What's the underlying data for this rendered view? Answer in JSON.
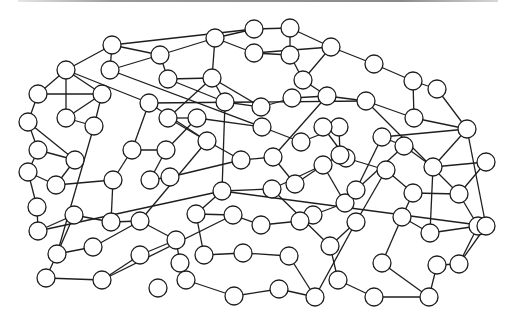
{
  "canvas": {
    "width": 512,
    "height": 322,
    "node_radius": 9,
    "node_fill": "#ffffff",
    "stroke_color": "#1e1e1e",
    "top_bar_color": "#8a8a8a"
  },
  "graph": {
    "nodes": [
      {
        "id": 0,
        "x": 112,
        "y": 45
      },
      {
        "id": 1,
        "x": 110,
        "y": 70
      },
      {
        "id": 2,
        "x": 66,
        "y": 70
      },
      {
        "id": 3,
        "x": 38,
        "y": 94
      },
      {
        "id": 4,
        "x": 102,
        "y": 94
      },
      {
        "id": 5,
        "x": 28,
        "y": 122
      },
      {
        "id": 6,
        "x": 66,
        "y": 118
      },
      {
        "id": 7,
        "x": 94,
        "y": 126
      },
      {
        "id": 8,
        "x": 149,
        "y": 103
      },
      {
        "id": 9,
        "x": 160,
        "y": 55
      },
      {
        "id": 10,
        "x": 168,
        "y": 79
      },
      {
        "id": 11,
        "x": 215,
        "y": 38
      },
      {
        "id": 12,
        "x": 254,
        "y": 29
      },
      {
        "id": 13,
        "x": 254,
        "y": 53
      },
      {
        "id": 14,
        "x": 212,
        "y": 78
      },
      {
        "id": 15,
        "x": 290,
        "y": 28
      },
      {
        "id": 16,
        "x": 290,
        "y": 55
      },
      {
        "id": 17,
        "x": 331,
        "y": 47
      },
      {
        "id": 18,
        "x": 303,
        "y": 80
      },
      {
        "id": 19,
        "x": 225,
        "y": 102
      },
      {
        "id": 20,
        "x": 261,
        "y": 107
      },
      {
        "id": 21,
        "x": 168,
        "y": 118
      },
      {
        "id": 22,
        "x": 197,
        "y": 118
      },
      {
        "id": 23,
        "x": 292,
        "y": 98
      },
      {
        "id": 24,
        "x": 327,
        "y": 96
      },
      {
        "id": 25,
        "x": 374,
        "y": 64
      },
      {
        "id": 26,
        "x": 413,
        "y": 81
      },
      {
        "id": 27,
        "x": 437,
        "y": 89
      },
      {
        "id": 28,
        "x": 366,
        "y": 101
      },
      {
        "id": 29,
        "x": 414,
        "y": 118
      },
      {
        "id": 30,
        "x": 467,
        "y": 129
      },
      {
        "id": 31,
        "x": 382,
        "y": 137
      },
      {
        "id": 32,
        "x": 339,
        "y": 127
      },
      {
        "id": 33,
        "x": 262,
        "y": 127
      },
      {
        "id": 34,
        "x": 301,
        "y": 142
      },
      {
        "id": 35,
        "x": 323,
        "y": 127
      },
      {
        "id": 36,
        "x": 207,
        "y": 141
      },
      {
        "id": 37,
        "x": 241,
        "y": 160
      },
      {
        "id": 38,
        "x": 273,
        "y": 157
      },
      {
        "id": 39,
        "x": 346,
        "y": 158
      },
      {
        "id": 40,
        "x": 404,
        "y": 146
      },
      {
        "id": 41,
        "x": 433,
        "y": 167
      },
      {
        "id": 42,
        "x": 486,
        "y": 162
      },
      {
        "id": 43,
        "x": 386,
        "y": 170
      },
      {
        "id": 44,
        "x": 38,
        "y": 150
      },
      {
        "id": 45,
        "x": 28,
        "y": 172
      },
      {
        "id": 46,
        "x": 75,
        "y": 160
      },
      {
        "id": 47,
        "x": 56,
        "y": 185
      },
      {
        "id": 48,
        "x": 132,
        "y": 150
      },
      {
        "id": 49,
        "x": 113,
        "y": 180
      },
      {
        "id": 50,
        "x": 166,
        "y": 150
      },
      {
        "id": 51,
        "x": 150,
        "y": 180
      },
      {
        "id": 52,
        "x": 170,
        "y": 177
      },
      {
        "id": 53,
        "x": 222,
        "y": 191
      },
      {
        "id": 54,
        "x": 272,
        "y": 189
      },
      {
        "id": 55,
        "x": 295,
        "y": 184
      },
      {
        "id": 56,
        "x": 323,
        "y": 165
      },
      {
        "id": 57,
        "x": 345,
        "y": 203
      },
      {
        "id": 58,
        "x": 313,
        "y": 215
      },
      {
        "id": 59,
        "x": 413,
        "y": 193
      },
      {
        "id": 60,
        "x": 459,
        "y": 194
      },
      {
        "id": 61,
        "x": 37,
        "y": 207
      },
      {
        "id": 62,
        "x": 38,
        "y": 231
      },
      {
        "id": 63,
        "x": 74,
        "y": 215
      },
      {
        "id": 64,
        "x": 111,
        "y": 222
      },
      {
        "id": 65,
        "x": 140,
        "y": 221
      },
      {
        "id": 66,
        "x": 57,
        "y": 254
      },
      {
        "id": 67,
        "x": 93,
        "y": 247
      },
      {
        "id": 68,
        "x": 46,
        "y": 278
      },
      {
        "id": 69,
        "x": 102,
        "y": 280
      },
      {
        "id": 70,
        "x": 140,
        "y": 255
      },
      {
        "id": 71,
        "x": 158,
        "y": 288
      },
      {
        "id": 72,
        "x": 176,
        "y": 240
      },
      {
        "id": 73,
        "x": 180,
        "y": 263
      },
      {
        "id": 74,
        "x": 196,
        "y": 214
      },
      {
        "id": 75,
        "x": 233,
        "y": 215
      },
      {
        "id": 76,
        "x": 261,
        "y": 225
      },
      {
        "id": 77,
        "x": 300,
        "y": 221
      },
      {
        "id": 78,
        "x": 204,
        "y": 255
      },
      {
        "id": 79,
        "x": 243,
        "y": 253
      },
      {
        "id": 80,
        "x": 289,
        "y": 256
      },
      {
        "id": 81,
        "x": 186,
        "y": 280
      },
      {
        "id": 82,
        "x": 234,
        "y": 296
      },
      {
        "id": 83,
        "x": 279,
        "y": 289
      },
      {
        "id": 84,
        "x": 315,
        "y": 297
      },
      {
        "id": 85,
        "x": 356,
        "y": 222
      },
      {
        "id": 86,
        "x": 330,
        "y": 246
      },
      {
        "id": 87,
        "x": 382,
        "y": 263
      },
      {
        "id": 88,
        "x": 338,
        "y": 280
      },
      {
        "id": 89,
        "x": 374,
        "y": 297
      },
      {
        "id": 90,
        "x": 429,
        "y": 297
      },
      {
        "id": 91,
        "x": 402,
        "y": 217
      },
      {
        "id": 92,
        "x": 430,
        "y": 233
      },
      {
        "id": 93,
        "x": 478,
        "y": 226
      },
      {
        "id": 94,
        "x": 459,
        "y": 264
      },
      {
        "id": 95,
        "x": 437,
        "y": 265
      },
      {
        "id": 96,
        "x": 486,
        "y": 226
      },
      {
        "id": 97,
        "x": 356,
        "y": 190
      },
      {
        "id": 98,
        "x": 340,
        "y": 155
      }
    ],
    "edges": [
      [
        0,
        1
      ],
      [
        0,
        2
      ],
      [
        0,
        12
      ],
      [
        0,
        9
      ],
      [
        1,
        9
      ],
      [
        2,
        3
      ],
      [
        2,
        4
      ],
      [
        2,
        6
      ],
      [
        3,
        5
      ],
      [
        4,
        6
      ],
      [
        4,
        7
      ],
      [
        6,
        7
      ],
      [
        5,
        44
      ],
      [
        2,
        8
      ],
      [
        9,
        10
      ],
      [
        9,
        11
      ],
      [
        10,
        14
      ],
      [
        11,
        12
      ],
      [
        11,
        13
      ],
      [
        11,
        14
      ],
      [
        12,
        15
      ],
      [
        13,
        16
      ],
      [
        15,
        16
      ],
      [
        15,
        17
      ],
      [
        16,
        18
      ],
      [
        17,
        25
      ],
      [
        17,
        18
      ],
      [
        13,
        17
      ],
      [
        14,
        19
      ],
      [
        14,
        20
      ],
      [
        19,
        20
      ],
      [
        20,
        23
      ],
      [
        23,
        24
      ],
      [
        24,
        28
      ],
      [
        18,
        24
      ],
      [
        25,
        26
      ],
      [
        26,
        27
      ],
      [
        27,
        30
      ],
      [
        28,
        29
      ],
      [
        29,
        30
      ],
      [
        30,
        31
      ],
      [
        31,
        40
      ],
      [
        30,
        41
      ],
      [
        29,
        26
      ],
      [
        8,
        28
      ],
      [
        10,
        19
      ],
      [
        21,
        22
      ],
      [
        21,
        36
      ],
      [
        22,
        33
      ],
      [
        33,
        34
      ],
      [
        34,
        32
      ],
      [
        32,
        35
      ],
      [
        35,
        39
      ],
      [
        36,
        37
      ],
      [
        37,
        38
      ],
      [
        38,
        55
      ],
      [
        39,
        43
      ],
      [
        40,
        41
      ],
      [
        41,
        42
      ],
      [
        42,
        60
      ],
      [
        43,
        59
      ],
      [
        59,
        60
      ],
      [
        44,
        45
      ],
      [
        44,
        46
      ],
      [
        45,
        61
      ],
      [
        46,
        47
      ],
      [
        47,
        49
      ],
      [
        48,
        49
      ],
      [
        48,
        50
      ],
      [
        48,
        8
      ],
      [
        50,
        51
      ],
      [
        51,
        52
      ],
      [
        52,
        37
      ],
      [
        49,
        64
      ],
      [
        61,
        62
      ],
      [
        62,
        63
      ],
      [
        63,
        64
      ],
      [
        63,
        66
      ],
      [
        64,
        65
      ],
      [
        65,
        67
      ],
      [
        66,
        67
      ],
      [
        66,
        68
      ],
      [
        68,
        69
      ],
      [
        69,
        70
      ],
      [
        70,
        72
      ],
      [
        72,
        73
      ],
      [
        73,
        81
      ],
      [
        74,
        75
      ],
      [
        75,
        76
      ],
      [
        76,
        77
      ],
      [
        74,
        78
      ],
      [
        78,
        79
      ],
      [
        79,
        80
      ],
      [
        80,
        84
      ],
      [
        81,
        82
      ],
      [
        82,
        83
      ],
      [
        83,
        84
      ],
      [
        84,
        85
      ],
      [
        85,
        86
      ],
      [
        86,
        88
      ],
      [
        88,
        89
      ],
      [
        89,
        90
      ],
      [
        90,
        87
      ],
      [
        87,
        91
      ],
      [
        91,
        92
      ],
      [
        92,
        93
      ],
      [
        93,
        94
      ],
      [
        94,
        95
      ],
      [
        95,
        90
      ],
      [
        60,
        93
      ],
      [
        59,
        91
      ],
      [
        57,
        58
      ],
      [
        58,
        77
      ],
      [
        56,
        57
      ],
      [
        56,
        54
      ],
      [
        54,
        53
      ],
      [
        53,
        74
      ],
      [
        55,
        56
      ],
      [
        97,
        57
      ],
      [
        98,
        56
      ],
      [
        32,
        98
      ],
      [
        7,
        66
      ],
      [
        1,
        33
      ],
      [
        21,
        14
      ],
      [
        19,
        53
      ],
      [
        36,
        65
      ],
      [
        65,
        72
      ],
      [
        62,
        53
      ],
      [
        69,
        75
      ],
      [
        53,
        96
      ],
      [
        30,
        96
      ],
      [
        96,
        94
      ],
      [
        28,
        60
      ],
      [
        31,
        97
      ],
      [
        40,
        97
      ],
      [
        43,
        85
      ],
      [
        41,
        92
      ],
      [
        5,
        46
      ],
      [
        45,
        47
      ],
      [
        3,
        4
      ],
      [
        8,
        36
      ],
      [
        22,
        50
      ],
      [
        54,
        86
      ],
      [
        24,
        38
      ]
    ]
  }
}
